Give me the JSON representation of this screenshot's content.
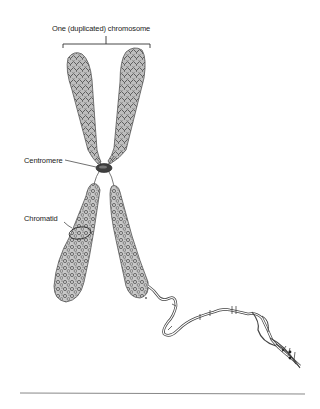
{
  "diagram": {
    "title_label": "One (duplicated) chromosome",
    "labels": {
      "centromere": "Centromere",
      "chromatid": "Chromatid"
    },
    "parts": [
      "chromatid-upper-left",
      "chromatid-upper-right",
      "centromere",
      "chromatid-lower-left",
      "chromatid-lower-right",
      "dna-double-helix"
    ],
    "colors": {
      "chromatin": "#6e6e6e",
      "chromatin_light": "#b8b8b8",
      "centromere": "#3a3a3a",
      "line": "#333333",
      "rule": "#888888"
    }
  }
}
